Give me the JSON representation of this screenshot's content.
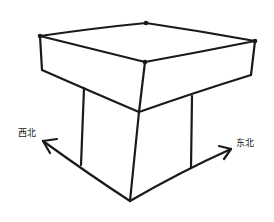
{
  "diagram": {
    "labels": {
      "northwest": "西北",
      "northeast": "东北"
    },
    "stroke_color": "#1a1a1a",
    "background": "#ffffff"
  }
}
